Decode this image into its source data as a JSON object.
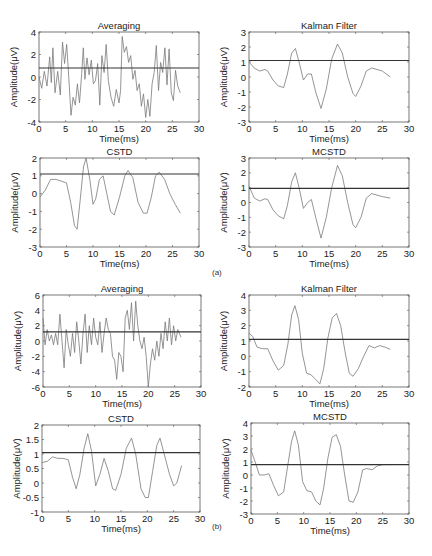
{
  "figure": {
    "sublabels": [
      {
        "text": "(a)",
        "x": 212,
        "y": 268
      },
      {
        "text": "(b)",
        "x": 212,
        "y": 522
      }
    ]
  },
  "chart_data": [
    {
      "panel": "a",
      "type": "line",
      "title": "Averaging",
      "xlabel": "Time(ms)",
      "ylabel": "Amplitude(μV)",
      "xlim": [
        0,
        30
      ],
      "ylim": [
        -4,
        4
      ],
      "xticks": [
        0,
        5,
        10,
        15,
        20,
        25,
        30
      ],
      "yticks": [
        -4,
        -2,
        0,
        2,
        4
      ],
      "box": {
        "left": 39,
        "top": 32,
        "right": 199,
        "bottom": 122
      },
      "threshold": 0.8,
      "x": [
        0,
        0.5,
        1,
        1.5,
        2,
        2.3,
        2.6,
        3,
        3.5,
        4,
        4.4,
        4.8,
        5.2,
        5.6,
        6,
        6.4,
        6.8,
        7.2,
        7.6,
        8,
        8.3,
        8.6,
        9,
        9.4,
        9.8,
        10.2,
        10.6,
        11,
        11.4,
        11.8,
        12.2,
        12.6,
        13,
        13.5,
        14,
        14.5,
        15,
        15.3,
        15.6,
        16,
        16.4,
        16.8,
        17.2,
        17.6,
        18,
        18.4,
        18.8,
        19.2,
        19.6,
        20,
        20.4,
        20.8,
        21.2,
        21.6,
        22,
        22.4,
        22.8,
        23.2,
        23.6,
        24,
        24.4,
        24.8,
        25.2,
        25.6,
        26,
        26.5
      ],
      "values": [
        0,
        -1,
        0.5,
        -0.8,
        1.8,
        -0.5,
        2.6,
        -1.4,
        0.5,
        -1.6,
        3.1,
        1.2,
        2.9,
        -0.2,
        -3.4,
        -1.8,
        -2.5,
        -0.6,
        -2.3,
        0.3,
        2.6,
        -0.2,
        1.7,
        0.2,
        1.5,
        -0.6,
        -0.3,
        1.2,
        -2.5,
        1.9,
        0.4,
        2.9,
        -0.3,
        -1.8,
        -2.6,
        -1.1,
        -2.3,
        -1.2,
        3.6,
        2.2,
        2.7,
        1.3,
        1.9,
        -0.2,
        0.6,
        -1.2,
        -0.6,
        -2.6,
        -1.5,
        -3.6,
        -2.0,
        -3.5,
        -0.6,
        0.4,
        2.8,
        -1.2,
        1.3,
        0.4,
        2.6,
        -0.7,
        2.5,
        -1.4,
        -2.1,
        0.6,
        -0.8,
        -1.4
      ]
    },
    {
      "panel": "a",
      "type": "line",
      "title": "Kalman Filter",
      "xlabel": "Time(ms)",
      "ylabel": "Amplitude(μV)",
      "xlim": [
        0,
        30
      ],
      "ylim": [
        -3,
        3
      ],
      "xticks": [
        0,
        5,
        10,
        15,
        20,
        25,
        30
      ],
      "yticks": [
        -3,
        -2,
        -1,
        0,
        1,
        2,
        3
      ],
      "box": {
        "left": 249,
        "top": 32,
        "right": 409,
        "bottom": 122
      },
      "threshold": 1.1,
      "x": [
        0,
        1,
        2,
        3,
        3.5,
        4.5,
        5.5,
        6.5,
        7.2,
        8,
        8.7,
        9.4,
        10.2,
        11,
        11.7,
        12.5,
        13.5,
        14.5,
        15.5,
        16.6,
        17.5,
        18.5,
        19.5,
        20,
        21,
        22,
        23,
        24,
        25,
        26.5
      ],
      "values": [
        1.0,
        0.6,
        0.4,
        0.5,
        0.4,
        -0.2,
        -0.6,
        -0.7,
        0.2,
        1.6,
        1.9,
        1.0,
        -0.2,
        0.2,
        0.2,
        -1.0,
        -2.1,
        -0.8,
        1.2,
        2.2,
        1.6,
        0.0,
        -1.1,
        -1.3,
        -0.6,
        0.4,
        0.6,
        0.5,
        0.4,
        0.0
      ]
    },
    {
      "panel": "a",
      "type": "line",
      "title": "CSTD",
      "xlabel": "Time(ms)",
      "ylabel": "Amplitude(μV)",
      "xlim": [
        0,
        30
      ],
      "ylim": [
        -3,
        2
      ],
      "xticks": [
        0,
        5,
        10,
        15,
        20,
        25,
        30
      ],
      "yticks": [
        -3,
        -2,
        -1,
        0,
        1,
        2
      ],
      "box": {
        "left": 40,
        "top": 158,
        "right": 199,
        "bottom": 247
      },
      "threshold": 1.1,
      "x": [
        0,
        1,
        2,
        3,
        4,
        5,
        5.8,
        6.5,
        7,
        7.6,
        8.2,
        8.7,
        9.4,
        10,
        10.5,
        11.2,
        11.9,
        12.6,
        13.3,
        14,
        15,
        16,
        16.6,
        17.5,
        18.5,
        19.5,
        20.2,
        21,
        21.8,
        22.5,
        23.5,
        24.5,
        25.5,
        26.5
      ],
      "values": [
        -0.2,
        0.2,
        0.8,
        0.8,
        0.7,
        0.6,
        -0.5,
        -1.8,
        -2.0,
        -0.3,
        1.5,
        2.0,
        0.8,
        -0.6,
        -0.3,
        0.8,
        1.0,
        0.0,
        -1.0,
        -1.2,
        -0.2,
        1.0,
        1.3,
        0.9,
        -0.5,
        -1.1,
        -1.1,
        -0.2,
        1.0,
        1.2,
        0.8,
        0.0,
        -0.6,
        -1.1
      ]
    },
    {
      "panel": "a",
      "type": "line",
      "title": "MCSTD",
      "xlabel": "Time(ms)",
      "ylabel": "Amplitude(μV)",
      "xlim": [
        0,
        30
      ],
      "ylim": [
        -3,
        3
      ],
      "xticks": [
        0,
        5,
        10,
        15,
        20,
        25,
        30
      ],
      "yticks": [
        -3,
        -2,
        -1,
        0,
        1,
        2,
        3
      ],
      "box": {
        "left": 249,
        "top": 158,
        "right": 409,
        "bottom": 247
      },
      "threshold": 0.95,
      "x": [
        0,
        1,
        2,
        3,
        3.5,
        4.5,
        5.5,
        6.5,
        7.2,
        8,
        8.7,
        9.4,
        10.2,
        11,
        11.7,
        12.5,
        13.5,
        14.5,
        15.5,
        16.6,
        17.5,
        18.5,
        19.5,
        20,
        21,
        22,
        23,
        24,
        25,
        26.5
      ],
      "values": [
        1.1,
        0.3,
        0.1,
        0.25,
        0.2,
        -0.5,
        -0.9,
        -1.1,
        -0.2,
        1.4,
        2.0,
        1.0,
        -0.4,
        0.0,
        0.2,
        -1.0,
        -2.4,
        -1.0,
        1.0,
        2.5,
        1.8,
        0.0,
        -1.5,
        -1.7,
        -1.0,
        0.3,
        0.6,
        0.5,
        0.4,
        0.3
      ]
    },
    {
      "panel": "b",
      "type": "line",
      "title": "Averaging",
      "xlabel": "Time(ms)",
      "ylabel": "Amplitude(μV)",
      "xlim": [
        0,
        30
      ],
      "ylim": [
        -6,
        6
      ],
      "xticks": [
        0,
        5,
        10,
        15,
        20,
        25,
        30
      ],
      "yticks": [
        -6,
        -4,
        -2,
        0,
        2,
        4,
        6
      ],
      "box": {
        "left": 43,
        "top": 295,
        "right": 201,
        "bottom": 387
      },
      "threshold": 1.2,
      "x": [
        0,
        0.4,
        0.8,
        1.2,
        1.6,
        2,
        2.4,
        2.8,
        3.2,
        3.6,
        4,
        4.4,
        4.8,
        5.2,
        5.6,
        6,
        6.4,
        6.8,
        7.2,
        7.6,
        8,
        8.4,
        8.8,
        9.2,
        9.6,
        10,
        10.4,
        10.8,
        11.2,
        11.6,
        12,
        12.4,
        12.8,
        13.2,
        13.6,
        14,
        14.4,
        14.8,
        15.2,
        15.6,
        16,
        16.4,
        16.8,
        17.2,
        17.6,
        18,
        18.4,
        18.8,
        19.2,
        19.6,
        20,
        20.4,
        20.8,
        21.2,
        21.6,
        22,
        22.4,
        22.8,
        23.2,
        23.6,
        24,
        24.4,
        24.8,
        25.2,
        25.6,
        26.2
      ],
      "values": [
        3,
        -0.5,
        1.5,
        0,
        0.8,
        -0.5,
        1,
        -0.5,
        3.5,
        0,
        -3.5,
        1.5,
        -0.5,
        -2,
        1,
        -1.5,
        2.5,
        0,
        -3,
        1,
        3.5,
        -1.5,
        2,
        -0.5,
        3,
        0.5,
        -0.5,
        2.5,
        -1.5,
        1,
        3,
        1.5,
        1,
        -2,
        -2.5,
        -5,
        -1.5,
        -2,
        -4,
        3,
        4,
        1.5,
        5,
        0,
        5.2,
        2,
        0,
        -1,
        0.5,
        -2,
        -6,
        -3,
        -1,
        -2.5,
        0,
        -2,
        1,
        -1,
        2.5,
        0,
        3,
        -0.5,
        2,
        0,
        1.5,
        0.5
      ]
    },
    {
      "panel": "b",
      "type": "line",
      "title": "Kalman Filter",
      "xlabel": "Time(ms)",
      "ylabel": "Amplitude(μV)",
      "xlim": [
        0,
        30
      ],
      "ylim": [
        -2,
        4
      ],
      "xticks": [
        0,
        5,
        10,
        15,
        20,
        25,
        30
      ],
      "yticks": [
        -2,
        -1,
        0,
        1,
        2,
        3,
        4
      ],
      "box": {
        "left": 249,
        "top": 295,
        "right": 409,
        "bottom": 387
      },
      "threshold": 1.1,
      "x": [
        0,
        0.7,
        1.5,
        2.5,
        3.5,
        4.5,
        5.5,
        6.5,
        7.3,
        8,
        8.6,
        9.3,
        10,
        10.8,
        11.6,
        12.5,
        13.3,
        14,
        14.8,
        15.6,
        16.4,
        17.2,
        18,
        18.8,
        19.5,
        20.5,
        21.5,
        22.5,
        23.5,
        24.5,
        25.5,
        26.5
      ],
      "values": [
        1.5,
        1.3,
        0.6,
        0.5,
        0.5,
        -0.3,
        -0.9,
        -0.6,
        0.8,
        2.7,
        3.3,
        2.4,
        0.2,
        -1.1,
        -1.2,
        -1.5,
        -1.8,
        -0.8,
        1.2,
        2.5,
        2.8,
        2.0,
        0.3,
        -1.1,
        -1.3,
        -0.8,
        0.0,
        0.7,
        0.55,
        0.7,
        0.6,
        0.45
      ]
    },
    {
      "panel": "b",
      "type": "line",
      "title": "CSTD",
      "xlabel": "Time(ms)",
      "ylabel": "Amplitude(μV)",
      "xlim": [
        0,
        30
      ],
      "ylim": [
        -1,
        2
      ],
      "xticks": [
        0,
        5,
        10,
        15,
        20,
        25,
        30
      ],
      "yticks": [
        -1,
        -0.5,
        0,
        0.5,
        1,
        1.5,
        2
      ],
      "box": {
        "left": 42,
        "top": 425,
        "right": 200,
        "bottom": 512
      },
      "threshold": 1.05,
      "x": [
        0,
        1,
        2,
        3,
        4,
        5,
        5.8,
        6.5,
        7.2,
        8,
        8.7,
        9.4,
        10.2,
        11,
        11.8,
        12.6,
        13.4,
        14,
        15,
        16,
        17,
        17.8,
        18.8,
        19.6,
        20.2,
        21,
        21.8,
        22.4,
        23.2,
        24.2,
        25,
        25.6,
        26.5
      ],
      "values": [
        0.7,
        0.75,
        0.9,
        0.85,
        0.85,
        0.8,
        0.2,
        -0.2,
        0.3,
        1.2,
        1.7,
        1.1,
        -0.1,
        0.3,
        0.85,
        0.4,
        -0.2,
        -0.25,
        0.3,
        1.2,
        1.55,
        1.0,
        -0.2,
        -0.5,
        -0.5,
        0.4,
        1.3,
        1.55,
        1.0,
        0.3,
        -0.1,
        0.0,
        0.6
      ]
    },
    {
      "panel": "b",
      "type": "line",
      "title": "MCSTD",
      "xlabel": "Time(ms)",
      "ylabel": "Amplitude(μV)",
      "xlim": [
        0,
        30
      ],
      "ylim": [
        -3,
        4
      ],
      "xticks": [
        0,
        5,
        10,
        15,
        20,
        25,
        30
      ],
      "yticks": [
        -3,
        -2,
        -1,
        0,
        1,
        2,
        3,
        4
      ],
      "box": {
        "left": 251,
        "top": 423,
        "right": 409,
        "bottom": 514
      },
      "threshold": 0.8,
      "x": [
        0,
        0.8,
        1.6,
        2.5,
        3.4,
        4.3,
        5.2,
        6.2,
        7,
        7.7,
        8.3,
        9,
        9.8,
        10.6,
        11.5,
        12.3,
        13.1,
        13.8,
        14.6,
        15.4,
        16.2,
        17,
        17.8,
        18.6,
        19.4,
        20.3,
        21.2,
        22,
        23,
        24,
        25,
        26.5
      ],
      "values": [
        1.9,
        1.0,
        0.0,
        0.0,
        0.1,
        -0.8,
        -1.6,
        -1.3,
        0.8,
        2.6,
        3.4,
        2.3,
        -0.5,
        -1.2,
        -1.3,
        -2.0,
        -2.3,
        -1.0,
        1.3,
        2.9,
        3.1,
        2.2,
        0.0,
        -2.0,
        -2.1,
        -1.3,
        0.4,
        0.5,
        0.4,
        0.7,
        0.8,
        0.8
      ]
    }
  ]
}
